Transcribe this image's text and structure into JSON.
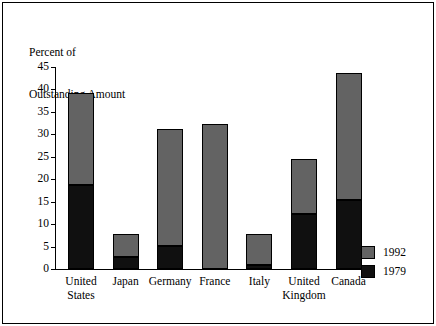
{
  "chart_data": {
    "type": "bar",
    "subtype": "stacked-vertical",
    "title": "Percent of Outstanding Amount",
    "title_lines": [
      "Percent of",
      "Outstanding Amount"
    ],
    "xlabel": "",
    "ylabel": "Percent of Outstanding Amount",
    "ylim": [
      0,
      45
    ],
    "yticks": [
      0,
      5,
      10,
      15,
      20,
      25,
      30,
      35,
      40,
      45
    ],
    "ytick_labels": [
      "0",
      "5",
      "10",
      "15",
      "20",
      "25",
      "30",
      "35",
      "40",
      "45"
    ],
    "grid": false,
    "legend_position": "right-bottom",
    "categories": [
      "United States",
      "Japan",
      "Germany",
      "France",
      "Italy",
      "United Kingdom",
      "Canada"
    ],
    "category_lines": [
      [
        "United",
        "States"
      ],
      [
        "Japan"
      ],
      [
        "Germany"
      ],
      [
        "France"
      ],
      [
        "Italy"
      ],
      [
        "United",
        "Kingdom"
      ],
      [
        "Canada"
      ]
    ],
    "series": [
      {
        "name": "1979",
        "color": "#101010",
        "values": [
          18.8,
          2.6,
          5.1,
          0.0,
          1.0,
          12.2,
          15.3
        ]
      },
      {
        "name": "1992",
        "color": "#636363",
        "values": [
          20.2,
          5.0,
          25.9,
          32.0,
          6.6,
          12.1,
          28.2
        ]
      }
    ],
    "totals": [
      39.0,
      7.6,
      31.0,
      32.0,
      7.6,
      24.3,
      43.5
    ],
    "stack_order": [
      "1979",
      "1992"
    ],
    "annotations": []
  },
  "legend": {
    "items": [
      {
        "label": "1992",
        "color": "#636363"
      },
      {
        "label": "1979",
        "color": "#101010"
      }
    ]
  },
  "colors": {
    "bar_1992": "#636363",
    "bar_1979": "#101010",
    "axis": "#000000",
    "frame": "#000000",
    "background": "#ffffff"
  }
}
